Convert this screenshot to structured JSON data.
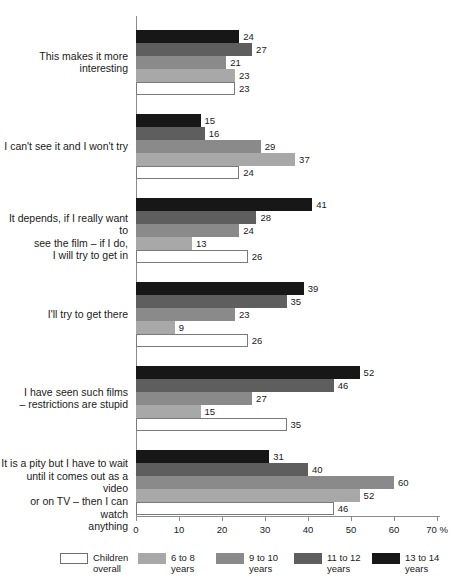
{
  "chart_data": {
    "type": "bar",
    "orientation": "horizontal",
    "title": "",
    "xlabel": "%",
    "ylabel": "",
    "xlim": [
      0,
      70
    ],
    "xticks": [
      0,
      10,
      20,
      30,
      40,
      50,
      60,
      70
    ],
    "xtick_labels": [
      "0",
      "10",
      "20",
      "30",
      "40",
      "50",
      "60",
      "70 %"
    ],
    "grid": false,
    "legend_position": "bottom",
    "categories": [
      "This makes it more\ninteresting",
      "I can't see it and I won't try",
      "It depends, if I really want to\nsee the film – if I do,\nI will try to get in",
      "I'll try to get there",
      "I have seen such films\n– restrictions are stupid",
      "It is a pity but I have to wait\nuntil it comes out as a video\nor on TV – then I can watch\nanything"
    ],
    "series": [
      {
        "name": "Children\noverall",
        "color": "#ffffff",
        "values": [
          23,
          24,
          26,
          26,
          35,
          46
        ]
      },
      {
        "name": "6 to 8\nyears",
        "color": "#a8a8a8",
        "values": [
          23,
          37,
          13,
          9,
          15,
          52
        ]
      },
      {
        "name": "9 to 10\nyears",
        "color": "#8a8a8a",
        "values": [
          21,
          29,
          24,
          23,
          27,
          60
        ]
      },
      {
        "name": "11 to 12\nyears",
        "color": "#5e5e5e",
        "values": [
          27,
          16,
          28,
          35,
          46,
          40
        ]
      },
      {
        "name": "13 to 14\nyears",
        "color": "#171717",
        "values": [
          24,
          15,
          41,
          39,
          52,
          31
        ]
      }
    ]
  }
}
